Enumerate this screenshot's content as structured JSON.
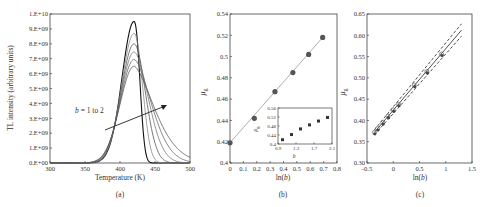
{
  "chart_data": [
    {
      "panel": "(a)",
      "type": "line",
      "xlabel": "Temperature (K)",
      "ylabel": "TL intensity (arbitrary units)",
      "xlim": [
        300,
        500
      ],
      "ylim": [
        0,
        10000000000.0
      ],
      "xticks": [
        "300",
        "350",
        "400",
        "450",
        "500"
      ],
      "yticks": [
        "0.E+00",
        "1.E+09",
        "2.E+09",
        "3.E+09",
        "4.E+09",
        "5.E+09",
        "6.E+09",
        "7.E+09",
        "8.E+09",
        "9.E+09",
        "1.E+10"
      ],
      "annotation": "b = 1 to 2",
      "peak_temperature": 420,
      "series": [
        {
          "name": "b=1.0",
          "b": 1.0,
          "peak": 9500000000.0
        },
        {
          "name": "b=1.2",
          "b": 1.2,
          "peak": 8700000000.0
        },
        {
          "name": "b=1.4",
          "b": 1.4,
          "peak": 8000000000.0
        },
        {
          "name": "b=1.6",
          "b": 1.6,
          "peak": 7450000000.0
        },
        {
          "name": "b=1.8",
          "b": 1.8,
          "peak": 6950000000.0
        },
        {
          "name": "b=2.0",
          "b": 2.0,
          "peak": 6500000000.0
        }
      ],
      "grid": false
    },
    {
      "panel": "(b)",
      "type": "scatter",
      "xlabel": "ln(b)",
      "ylabel": "μg",
      "xlim": [
        0,
        0.8
      ],
      "ylim": [
        0.4,
        0.54
      ],
      "xticks": [
        "0",
        "0.1",
        "0.2",
        "0.3",
        "0.4",
        "0.5",
        "0.6",
        "0.7",
        "0.8"
      ],
      "yticks": [
        "0.4",
        "0.42",
        "0.44",
        "0.46",
        "0.48",
        "0.5",
        "0.52",
        "0.54"
      ],
      "x": [
        0,
        0.182,
        0.336,
        0.47,
        0.588,
        0.693
      ],
      "y": [
        0.419,
        0.442,
        0.467,
        0.485,
        0.502,
        0.518
      ],
      "fit_line": {
        "x": [
          0,
          0.7
        ],
        "y": [
          0.419,
          0.519
        ]
      },
      "inset": {
        "xlabel": "b",
        "ylabel": "μg",
        "xlim": [
          0.9,
          2.1
        ],
        "ylim": [
          0.4,
          0.56
        ],
        "xticks": [
          "0.9",
          "1.3",
          "1.7",
          "2.1"
        ],
        "yticks": [
          "0.4",
          "0.44",
          "0.48",
          "0.52",
          "0.56"
        ],
        "x": [
          1.0,
          1.2,
          1.4,
          1.6,
          1.8,
          2.0
        ],
        "y": [
          0.419,
          0.442,
          0.467,
          0.485,
          0.502,
          0.518
        ]
      },
      "grid": false
    },
    {
      "panel": "(c)",
      "type": "scatter",
      "xlabel": "ln(b)",
      "ylabel": "μg",
      "xlim": [
        -0.5,
        1.5
      ],
      "ylim": [
        0.3,
        0.65
      ],
      "xticks": [
        "-0.5",
        "0",
        "0.5",
        "1",
        "1.5"
      ],
      "yticks": [
        "0.30",
        "0.35",
        "0.40",
        "0.45",
        "0.50",
        "0.55",
        "0.60",
        "0.65"
      ],
      "x": [
        -0.36,
        -0.3,
        -0.2,
        -0.1,
        0,
        0.1,
        0.4,
        0.64,
        0.92
      ],
      "y": [
        0.372,
        0.381,
        0.395,
        0.41,
        0.425,
        0.438,
        0.483,
        0.515,
        0.556
      ],
      "fit_line": {
        "x": [
          -0.36,
          1.3
        ],
        "y": [
          0.372,
          0.612
        ]
      },
      "confidence_upper": {
        "x": [
          -0.36,
          1.3
        ],
        "y": [
          0.378,
          0.627
        ]
      },
      "confidence_lower": {
        "x": [
          -0.36,
          1.3
        ],
        "y": [
          0.366,
          0.598
        ]
      },
      "grid": false
    }
  ],
  "labels": {
    "a": {
      "xlabel": "Temperature (K)",
      "ylabel": "TL intensity (arbitrary units)",
      "caption": "(a)",
      "annotation_b": "b",
      "annotation_rest": " = 1 to 2"
    },
    "b": {
      "xlabel_pre": "ln(",
      "xlabel_var": "b",
      "xlabel_post": ")",
      "ylabel": "μ",
      "ylabel_sub": "g",
      "caption": "(b)",
      "inset_xlabel": "b"
    },
    "c": {
      "xlabel_pre": "ln(",
      "xlabel_var": "b",
      "xlabel_post": ")",
      "ylabel": "μ",
      "ylabel_sub": "g",
      "caption": "(c)"
    }
  }
}
